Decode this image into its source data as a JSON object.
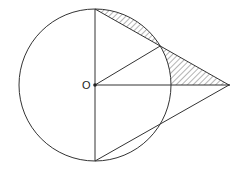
{
  "diagram": {
    "type": "geometry",
    "labels": {
      "center": "O"
    },
    "colors": {
      "stroke": "#333333",
      "hatch": "#444444",
      "background": "#ffffff"
    },
    "geometry": {
      "circle": {
        "cx": 95,
        "cy": 85,
        "r": 76
      },
      "points": {
        "O": [
          95,
          85
        ],
        "top": [
          95,
          9
        ],
        "bottom": [
          95,
          161
        ],
        "external": [
          229,
          85
        ],
        "upper_intersection": [
          160.2,
          46
        ],
        "lower_intersection": [
          160.2,
          124
        ],
        "circle_right": [
          171,
          85
        ]
      },
      "segments": [
        [
          "top",
          "bottom"
        ],
        [
          "top",
          "external"
        ],
        [
          "bottom",
          "external"
        ],
        [
          "O",
          "external"
        ],
        [
          "O",
          "upper_intersection"
        ]
      ],
      "shaded_regions": [
        "circular segment between chord top–upper_intersection and arc",
        "region bounded by upper_intersection–external, external–circle_right, and arc circle_right–upper_intersection"
      ]
    }
  }
}
